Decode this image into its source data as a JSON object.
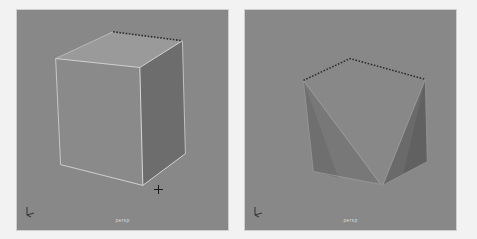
{
  "window": {
    "background_color": "#f2f2f2",
    "width": 477,
    "height": 239
  },
  "viewports": [
    {
      "id": "left",
      "label": "persp",
      "background_color": "#888888",
      "gizmo_name": "axis-gizmo",
      "cursor": {
        "name": "crosshair-cursor",
        "x": 158,
        "y": 189
      },
      "object": {
        "name": "polygon-cube",
        "state": "intact",
        "faces": [
          {
            "name": "front-face",
            "fill": "#8a8a8a",
            "points": "55,58 140,67 143,186 60,165"
          },
          {
            "name": "top-face",
            "fill": "#9a9a9a",
            "points": "55,58 113,31 183,40 140,67"
          },
          {
            "name": "right-face",
            "fill": "#6d6d6d",
            "points": "140,67 183,40 186,154 143,186"
          }
        ],
        "edges": [
          {
            "name": "edge-front-top",
            "points": "55,58 140,67",
            "stroke": "#d8d8d8"
          },
          {
            "name": "edge-front-left",
            "points": "55,58 60,165",
            "stroke": "#cfcfcf"
          },
          {
            "name": "edge-front-bottom",
            "points": "60,165 143,186",
            "stroke": "#d8d8d8"
          },
          {
            "name": "edge-front-right",
            "points": "140,67 143,186",
            "stroke": "#e2e2e2"
          },
          {
            "name": "edge-right-top",
            "points": "140,67 183,40",
            "stroke": "#dcdcdc"
          },
          {
            "name": "edge-right-back",
            "points": "183,40 186,154",
            "stroke": "#c9c9c9"
          },
          {
            "name": "edge-right-bottom",
            "points": "186,154 143,186",
            "stroke": "#dedede"
          }
        ],
        "selected_edge": {
          "name": "selected-top-back-edge",
          "points": "113,31 183,40",
          "stroke": "#2a2a2a",
          "dash": "1.6 1.6"
        },
        "silhouette_top_left": {
          "name": "edge-top-back-left",
          "points": "55,58 113,31",
          "stroke": "#bdbdbd"
        }
      }
    },
    {
      "id": "right",
      "label": "persp",
      "background_color": "#888888",
      "gizmo_name": "axis-gizmo",
      "object": {
        "name": "polygon-cube-faces-deleted",
        "state": "faces-deleted",
        "faces": [
          {
            "name": "left-triangle-face",
            "fill": "#787878",
            "points": "303,80 313,172 381,185"
          },
          {
            "name": "left-triangle-shade",
            "fill": "#6f6f6f",
            "points": "303,80 313,172 338,178"
          },
          {
            "name": "right-triangle-face",
            "fill": "#6a6a6a",
            "points": "426,79 428,162 383,186"
          },
          {
            "name": "right-triangle-shade",
            "fill": "#616161",
            "points": "426,79 428,162 404,174"
          }
        ],
        "edges": [
          {
            "name": "left-tri-edge-a",
            "points": "303,80 313,172",
            "stroke": "#9a9a9a"
          },
          {
            "name": "left-tri-edge-b",
            "points": "313,172 381,185",
            "stroke": "#9d9d9d"
          },
          {
            "name": "left-tri-edge-c",
            "points": "303,80 381,185",
            "stroke": "#a4a4a4"
          },
          {
            "name": "right-tri-edge-a",
            "points": "426,79 428,162",
            "stroke": "#9a9a9a"
          },
          {
            "name": "right-tri-edge-b",
            "points": "428,162 383,186",
            "stroke": "#969696"
          },
          {
            "name": "right-tri-edge-c",
            "points": "426,79 383,186",
            "stroke": "#a0a0a0"
          }
        ],
        "selected_edge": {
          "name": "selected-top-back-edge",
          "points": "303,80 350,58 426,79",
          "stroke": "#2a2a2a",
          "dash": "1.6 1.6"
        }
      }
    }
  ]
}
